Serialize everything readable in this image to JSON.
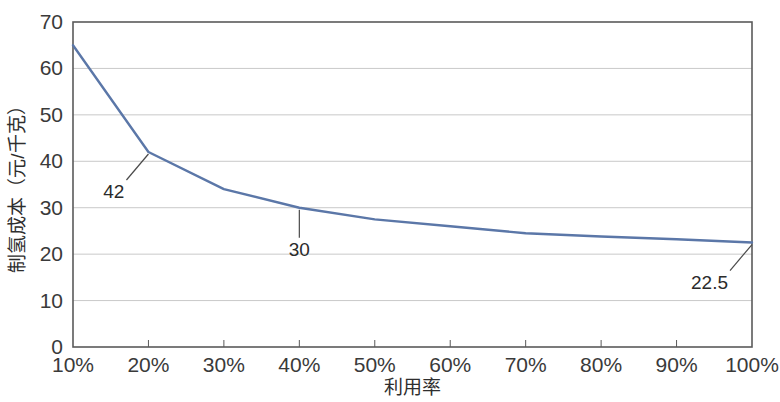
{
  "chart_data": {
    "type": "line",
    "title": "",
    "xlabel": "利用率",
    "ylabel": "制氢成本（元/千克）",
    "categories": [
      "10%",
      "20%",
      "30%",
      "40%",
      "50%",
      "60%",
      "70%",
      "80%",
      "90%",
      "100%"
    ],
    "x_numeric": [
      10,
      20,
      30,
      40,
      50,
      60,
      70,
      80,
      90,
      100
    ],
    "values": [
      65,
      42,
      34,
      30,
      27.5,
      26,
      24.5,
      23.8,
      23.2,
      22.5
    ],
    "series": [
      {
        "name": "制氢成本",
        "values": [
          65,
          42,
          34,
          30,
          27.5,
          26,
          24.5,
          23.8,
          23.2,
          22.5
        ],
        "color": "#5b77a8"
      }
    ],
    "ylim": [
      0,
      70
    ],
    "y_ticks": [
      "0",
      "10",
      "20",
      "30",
      "40",
      "50",
      "60",
      "70"
    ],
    "y_tick_values": [
      0,
      10,
      20,
      30,
      40,
      50,
      60,
      70
    ],
    "x_ticks": [
      "10%",
      "20%",
      "30%",
      "40%",
      "50%",
      "60%",
      "70%",
      "80%",
      "90%",
      "100%"
    ],
    "grid": true,
    "grid_axis": "y",
    "legend": "none",
    "annotations": [
      {
        "label": "42",
        "x_category": "20%",
        "value": 42,
        "leader": "down-left"
      },
      {
        "label": "30",
        "x_category": "40%",
        "value": 30,
        "leader": "down"
      },
      {
        "label": "22.5",
        "x_category": "100%",
        "value": 22.5,
        "leader": "down-left"
      }
    ],
    "colors": {
      "line": "#5b77a8",
      "grid": "#c9c9c9",
      "axis": "#5a5a5a",
      "text": "#2e2e2e",
      "background": "#ffffff"
    }
  }
}
